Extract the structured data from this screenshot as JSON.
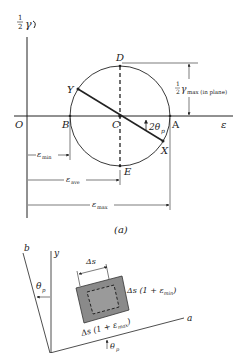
{
  "figure": {
    "caption": "(a)",
    "mohr_circle": {
      "vertical_axis_label": {
        "frac": "1/2",
        "symbol": "γ",
        "arrow": "↻"
      },
      "horizontal_axis_label": "ε",
      "origin_label": "O",
      "points": {
        "A": "A",
        "B": "B",
        "C": "C",
        "D": "D",
        "E": "E",
        "X": "X",
        "Y": "Y"
      },
      "angle_label": "2θ",
      "angle_sub": "p",
      "gamma_max_label": {
        "frac_num": "1",
        "frac_den": "2",
        "symbol": "γ",
        "sub": "max (in plane)"
      },
      "dimensions": {
        "eps_min": {
          "symbol": "ε",
          "sub": "min"
        },
        "eps_ave": {
          "symbol": "ε",
          "sub": "ave"
        },
        "eps_max": {
          "symbol": "ε",
          "sub": "max"
        }
      }
    },
    "element": {
      "axis_b": "b",
      "axis_y": "y",
      "axis_a": "a",
      "theta_label": "θ",
      "theta_sub": "p",
      "side_top": "Δs",
      "side_right": {
        "prefix": "Δs (1 + ",
        "symbol": "ε",
        "sub": "min",
        "suffix": ")"
      },
      "side_bottom": {
        "prefix": "Δs (1 + ",
        "symbol": "ε",
        "sub": "max",
        "suffix": ")"
      }
    }
  },
  "colors": {
    "line": "#222222",
    "element_fill": "#8a8a8a",
    "element_inner": "#9a9a9a"
  }
}
